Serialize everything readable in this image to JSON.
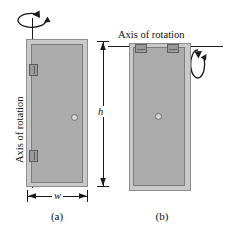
{
  "figure": {
    "background_color": "#ffffff",
    "door_color": "#ababab",
    "frame_color": "#c9c9c9",
    "line_color": "#1a1a1a"
  },
  "panel_a": {
    "caption": "(a)",
    "axis_label": "Axis of rotation",
    "axis_orientation": "vertical",
    "axis_position": "hinged left edge",
    "width_label": "w",
    "hinge_count": 2,
    "knob": "door-knob"
  },
  "panel_b": {
    "caption": "(b)",
    "axis_label": "Axis of rotation",
    "axis_orientation": "horizontal",
    "axis_position": "top edge",
    "hinge_count": 2,
    "knob": "door-knob"
  },
  "dimensions": {
    "height_label": "h",
    "width_label": "w"
  }
}
